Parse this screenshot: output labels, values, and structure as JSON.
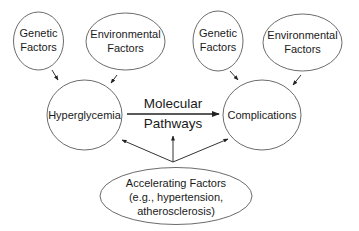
{
  "diagram": {
    "nodes": {
      "genetic_left": {
        "lines": [
          "Genetic",
          "Factors"
        ]
      },
      "environmental_left": {
        "lines": [
          "Environmental",
          "Factors"
        ]
      },
      "genetic_right": {
        "lines": [
          "Genetic",
          "Factors"
        ]
      },
      "environmental_right": {
        "lines": [
          "Environmental",
          "Factors"
        ]
      },
      "hyperglycemia": {
        "lines": [
          "Hyperglycemia"
        ]
      },
      "complications": {
        "lines": [
          "Complications"
        ]
      },
      "accelerating": {
        "lines": [
          "Accelerating Factors",
          "(e.g., hypertension,",
          "atherosclerosis)"
        ]
      }
    },
    "edges": {
      "molecular_pathways": {
        "lines": [
          "Molecular",
          "Pathways"
        ],
        "from": "hyperglycemia",
        "to": "complications"
      },
      "genetic_left_to_hyperglycemia": {
        "from": "genetic_left",
        "to": "hyperglycemia"
      },
      "environmental_left_to_hyperglycemia": {
        "from": "environmental_left",
        "to": "hyperglycemia"
      },
      "genetic_right_to_complications": {
        "from": "genetic_right",
        "to": "complications"
      },
      "environmental_right_to_complications": {
        "from": "environmental_right",
        "to": "complications"
      },
      "accelerating_to_hyperglycemia": {
        "from": "accelerating",
        "to": "hyperglycemia"
      },
      "accelerating_to_pathways": {
        "from": "accelerating",
        "to": "molecular_pathways"
      },
      "accelerating_to_complications": {
        "from": "accelerating",
        "to": "complications"
      }
    },
    "colors": {
      "stroke": "#5a5a5a",
      "text": "#1a1a1a",
      "background": "#ffffff"
    }
  }
}
